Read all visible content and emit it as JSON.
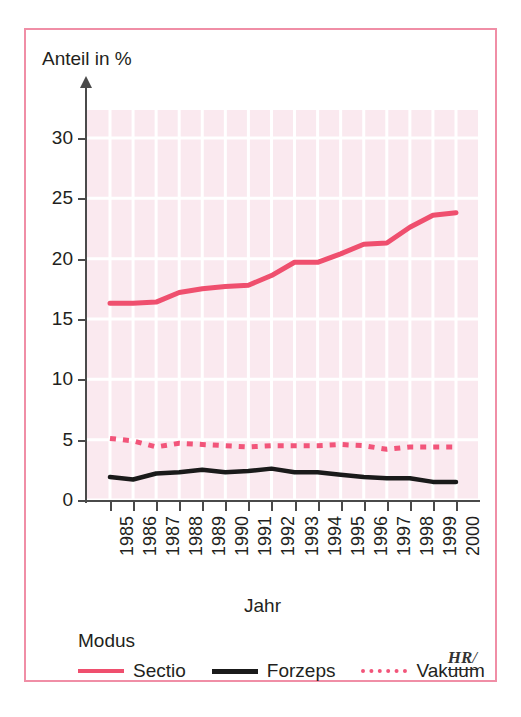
{
  "axes": {
    "y_title": "Anteil in %",
    "x_title": "Jahr",
    "y_ticks": [
      "0",
      "5",
      "10",
      "15",
      "20",
      "25",
      "30"
    ],
    "x_ticks": [
      "1985",
      "1986",
      "1987",
      "1988",
      "1989",
      "1990",
      "1991",
      "1992",
      "1993",
      "1994",
      "1995",
      "1996",
      "1997",
      "1998",
      "1999",
      "2000"
    ]
  },
  "legend": {
    "title": "Modus",
    "items": [
      {
        "label": "Sectio",
        "style": "solid-pink",
        "color": "#ef4f6e"
      },
      {
        "label": "Forzeps",
        "style": "solid-black",
        "color": "#1a1a1a"
      },
      {
        "label": "Vakuum",
        "style": "dotted-pink",
        "color": "#f2557a"
      }
    ]
  },
  "watermark": {
    "text": "HR",
    "slash": "/"
  },
  "colors": {
    "border": "#f08ea6",
    "plot_background": "#fae9ef",
    "gridline": "#ffffff",
    "axis": "#4a4a4a",
    "sectio": "#ef4f6e",
    "forzeps": "#1a1a1a",
    "vakuum": "#f2557a"
  },
  "chart_data": {
    "type": "line",
    "title": "",
    "xlabel": "Jahr",
    "ylabel": "Anteil in %",
    "categories": [
      "1985",
      "1986",
      "1987",
      "1988",
      "1989",
      "1990",
      "1991",
      "1992",
      "1993",
      "1994",
      "1995",
      "1996",
      "1997",
      "1998",
      "1999",
      "2000"
    ],
    "ylim": [
      0,
      32
    ],
    "yticks": [
      0,
      5,
      10,
      15,
      20,
      25,
      30
    ],
    "grid": true,
    "legend_position": "bottom",
    "series": [
      {
        "name": "Sectio",
        "color": "#ef4f6e",
        "linestyle": "solid",
        "values": [
          16.3,
          16.3,
          16.4,
          17.2,
          17.5,
          17.7,
          17.8,
          18.6,
          19.7,
          19.7,
          20.4,
          21.2,
          21.3,
          22.6,
          23.6,
          23.8
        ]
      },
      {
        "name": "Forzeps",
        "color": "#1a1a1a",
        "linestyle": "solid",
        "values": [
          1.9,
          1.7,
          2.2,
          2.3,
          2.5,
          2.3,
          2.4,
          2.6,
          2.3,
          2.3,
          2.1,
          1.9,
          1.8,
          1.8,
          1.5,
          1.5
        ]
      },
      {
        "name": "Vakuum",
        "color": "#f2557a",
        "linestyle": "dotted",
        "values": [
          5.1,
          4.9,
          4.4,
          4.7,
          4.6,
          4.5,
          4.4,
          4.5,
          4.5,
          4.5,
          4.6,
          4.5,
          4.2,
          4.4,
          4.4,
          4.4
        ]
      }
    ]
  }
}
